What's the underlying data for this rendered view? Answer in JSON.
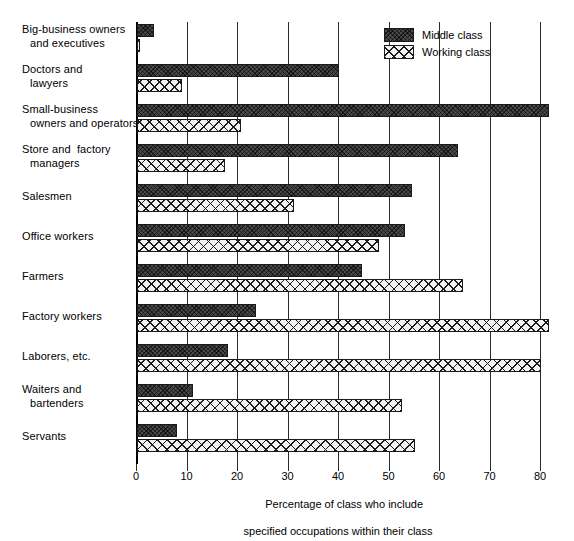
{
  "chart_data": {
    "type": "bar",
    "orientation": "horizontal",
    "title": "",
    "xlabel_line1": "Percentage of class who include",
    "xlabel_line2": "specified occupations within their class",
    "ylabel": "",
    "xlim": [
      0,
      84
    ],
    "xticks": [
      0,
      10,
      20,
      30,
      40,
      50,
      60,
      70,
      80
    ],
    "xticklabels": [
      "0",
      "10",
      "20",
      "30",
      "40",
      "50",
      "60",
      "70",
      "80"
    ],
    "grid": "vertical",
    "legend_position": "top-right",
    "categories": [
      "Big-business owners and executives",
      "Doctors and lawyers",
      "Small-business owners and operators",
      "Store and factory managers",
      "Salesmen",
      "Office workers",
      "Farmers",
      "Factory workers",
      "Laborers, etc.",
      "Waiters and bartenders",
      "Servants"
    ],
    "category_lines": [
      [
        "Big-business owners",
        "and executives"
      ],
      [
        "Doctors and",
        "lawyers"
      ],
      [
        "Small-business",
        "owners and operators"
      ],
      [
        "Store and  factory",
        "managers"
      ],
      [
        "Salesmen",
        ""
      ],
      [
        "Office workers",
        ""
      ],
      [
        "Farmers",
        ""
      ],
      [
        "Factory workers",
        ""
      ],
      [
        "Laborers, etc.",
        ""
      ],
      [
        "Waiters and",
        "bartenders"
      ],
      [
        "Servants",
        ""
      ]
    ],
    "series": [
      {
        "name": "Middle class",
        "color": "#4a4a4a",
        "pattern": "dark-hatch",
        "values": [
          3.3,
          40,
          81.5,
          63.5,
          54.5,
          53,
          44.5,
          23.5,
          18,
          11,
          8
        ]
      },
      {
        "name": "Working class",
        "color": "#f2f2f0",
        "pattern": "cross-hatch",
        "values": [
          0.5,
          9,
          20.5,
          17.5,
          31,
          48,
          64.5,
          81.5,
          80,
          52.5,
          55
        ]
      }
    ]
  },
  "legend": {
    "items": [
      {
        "label": "Middle class"
      },
      {
        "label": "Working class"
      }
    ]
  }
}
